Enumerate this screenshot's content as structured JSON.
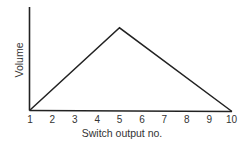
{
  "chart_data": {
    "type": "line",
    "title": "",
    "xlabel": "Switch output no.",
    "ylabel": "Volume",
    "x_ticks": [
      "1",
      "2",
      "3",
      "4",
      "5",
      "6",
      "7",
      "8",
      "9",
      "10"
    ],
    "x": [
      1,
      5,
      10
    ],
    "values": [
      0,
      1,
      0
    ],
    "series": [
      {
        "name": "Volume",
        "x": [
          1,
          5,
          10
        ],
        "values": [
          0,
          1,
          0
        ]
      }
    ],
    "xlim": [
      1,
      10
    ],
    "ylim": [
      0,
      1.25
    ],
    "y_ticks": [],
    "grid": false,
    "legend": null,
    "colors": {
      "line": "#222222",
      "axis": "#222222",
      "text": "#333333"
    }
  }
}
